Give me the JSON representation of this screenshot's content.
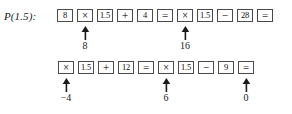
{
  "figure": {
    "type": "calculator-keystroke-diagram",
    "ink_color": "#1a1a1a",
    "box_border_color": "#4a4a4a",
    "background": "#ffffff"
  },
  "rows": [
    {
      "label": "P(1.5):",
      "has_label": true,
      "keys": [
        {
          "text": "8",
          "kind": "number",
          "annotation": null
        },
        {
          "text": "×",
          "kind": "operator",
          "annotation": {
            "arrow": "up-arrow-icon",
            "value": "8"
          }
        },
        {
          "text": "1.5",
          "kind": "number",
          "annotation": null
        },
        {
          "text": "+",
          "kind": "operator",
          "annotation": null
        },
        {
          "text": "4",
          "kind": "number",
          "annotation": null
        },
        {
          "text": "=",
          "kind": "operator",
          "annotation": null
        },
        {
          "text": "×",
          "kind": "operator",
          "annotation": {
            "arrow": "up-arrow-icon",
            "value": "16"
          }
        },
        {
          "text": "1.5",
          "kind": "number",
          "annotation": null
        },
        {
          "text": "−",
          "kind": "operator",
          "annotation": null
        },
        {
          "text": "28",
          "kind": "number",
          "annotation": null
        },
        {
          "text": "=",
          "kind": "operator",
          "annotation": null
        }
      ]
    },
    {
      "label": "",
      "has_label": false,
      "keys": [
        {
          "text": "×",
          "kind": "operator",
          "annotation": {
            "arrow": "up-arrow-icon",
            "value": "−4"
          }
        },
        {
          "text": "1.5",
          "kind": "number",
          "annotation": null
        },
        {
          "text": "+",
          "kind": "operator",
          "annotation": null
        },
        {
          "text": "12",
          "kind": "number",
          "annotation": null
        },
        {
          "text": "=",
          "kind": "operator",
          "annotation": null
        },
        {
          "text": "×",
          "kind": "operator",
          "annotation": {
            "arrow": "up-arrow-icon",
            "value": "6"
          }
        },
        {
          "text": "1.5",
          "kind": "number",
          "annotation": null
        },
        {
          "text": "−",
          "kind": "operator",
          "annotation": null
        },
        {
          "text": "9",
          "kind": "number",
          "annotation": null
        },
        {
          "text": "=",
          "kind": "operator",
          "annotation": {
            "arrow": "up-arrow-icon",
            "value": "0"
          }
        }
      ]
    }
  ]
}
